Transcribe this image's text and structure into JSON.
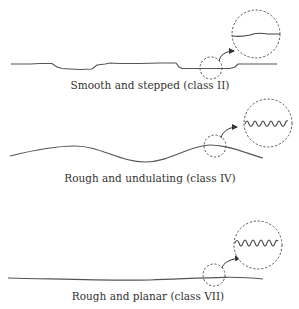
{
  "figure": {
    "panels": [
      {
        "id": "class-ii",
        "label": "Smooth and stepped (class II)",
        "roughness": "smooth",
        "waviness": "stepped",
        "class": "II"
      },
      {
        "id": "class-iv",
        "label": "Rough and undulating (class IV)",
        "roughness": "rough",
        "waviness": "undulating",
        "class": "IV"
      },
      {
        "id": "class-vii",
        "label": "Rough and planar (class VII)",
        "roughness": "rough",
        "waviness": "planar",
        "class": "VII"
      }
    ]
  },
  "colors": {
    "line": "#555555",
    "text": "#333333",
    "background": "#ffffff"
  }
}
